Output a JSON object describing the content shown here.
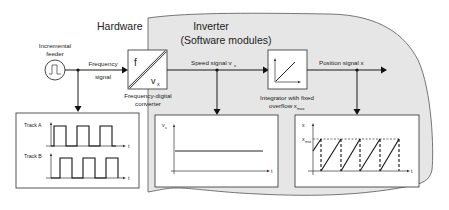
{
  "labels": {
    "hardware": "Hardware",
    "inverter_line1": "Inverter",
    "inverter_line2": "(Software modules)",
    "feeder_line1": "Incremental",
    "feeder_line2": "feeder",
    "freq_signal_line1": "Frequency",
    "freq_signal_line2": "signal",
    "converter_f": "f",
    "converter_v": "v",
    "converter_v_sub": "x",
    "converter_line1": "Frequency-digital",
    "converter_line2": "converter",
    "speed_signal": "Speed signal v",
    "speed_signal_sub": "x",
    "integrator_line1": "Integrator with fixed",
    "integrator_line2": "overflow x",
    "integrator_sub": "max",
    "position_signal": "Position signal x"
  },
  "plots": {
    "tracks": {
      "track_a": "Track A",
      "track_b": "Track B",
      "t_axis": "t"
    },
    "speed": {
      "y_label": "v",
      "y_sub": "x",
      "t_axis": "t"
    },
    "position": {
      "y_label": "x",
      "xmax_label": "x",
      "xmax_sub": "max",
      "t_axis": "t"
    }
  },
  "colors": {
    "inverter_fill": "#e6e6e6",
    "inverter_stroke": "#555555",
    "line": "#1a1a1a"
  }
}
